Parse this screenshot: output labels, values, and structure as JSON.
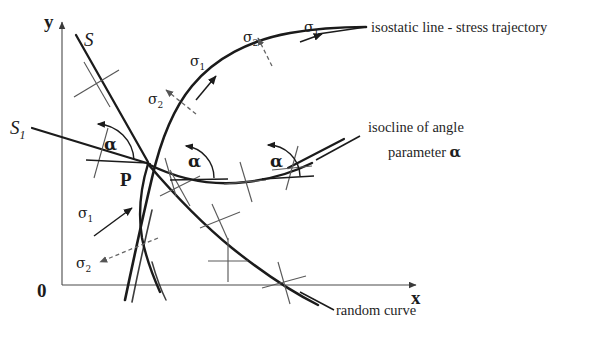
{
  "figure": {
    "type": "technical-diagram",
    "title": "",
    "background_color": "#ffffff",
    "ink_color": "#1b1b1b",
    "width": 616,
    "height": 338
  },
  "axes": {
    "y_label": "y",
    "x_label": "x",
    "origin_label": "0",
    "x_axis_from": [
      62,
      285
    ],
    "x_axis_to": [
      420,
      285
    ],
    "y_axis_from": [
      62,
      285
    ],
    "y_axis_to": [
      62,
      18
    ]
  },
  "points": {
    "p_label": "P"
  },
  "lines": {
    "s_label": "S",
    "s1_label": "S",
    "s1_subscript": "1"
  },
  "stress_labels": {
    "sigma": "σ",
    "sub_1": "1",
    "sub_2": "2",
    "items": [
      {
        "id": "sigma1-lower",
        "symbol": "σ",
        "subscript": "1",
        "x": 78,
        "y": 214
      },
      {
        "id": "sigma2-lower",
        "symbol": "σ",
        "subscript": "2",
        "x": 76,
        "y": 264
      },
      {
        "id": "sigma2-mid",
        "symbol": "σ",
        "subscript": "2",
        "x": 148,
        "y": 100
      },
      {
        "id": "sigma1-mid",
        "symbol": "σ",
        "subscript": "1",
        "x": 190,
        "y": 62
      },
      {
        "id": "sigma2-upper",
        "symbol": "σ",
        "subscript": "2",
        "x": 243,
        "y": 38
      },
      {
        "id": "sigma1-upper",
        "symbol": "σ",
        "subscript": "1",
        "x": 304,
        "y": 28
      }
    ]
  },
  "angle_markers": {
    "label": "α",
    "items": [
      {
        "id": "alpha-left",
        "x": 104,
        "y": 136
      },
      {
        "id": "alpha-middle",
        "x": 188,
        "y": 152
      },
      {
        "id": "alpha-right",
        "x": 270,
        "y": 152
      }
    ]
  },
  "captions": {
    "isostatic": "isostatic line - stress trajectory",
    "isocline_line1": "isocline of angle",
    "isocline_line2_prefix": "parameter ",
    "isocline_line2_symbol": "α",
    "random_curve": "random curve"
  }
}
